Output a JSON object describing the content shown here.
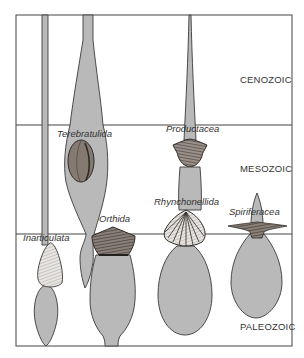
{
  "diagram": {
    "type": "spindle-diagram",
    "eras": [
      {
        "name": "CENOZOIC",
        "label_x": 240,
        "label_y": 83
      },
      {
        "name": "MESOZOIC",
        "label_x": 240,
        "label_y": 172
      },
      {
        "name": "PALEOZOIC",
        "label_x": 240,
        "label_y": 330
      }
    ],
    "taxa": [
      {
        "name": "Inarticulata",
        "label_x": 23,
        "label_y": 241
      },
      {
        "name": "Terebratulida",
        "label_x": 57,
        "label_y": 137
      },
      {
        "name": "Orthida",
        "label_x": 99,
        "label_y": 222
      },
      {
        "name": "Productacea",
        "label_x": 166,
        "label_y": 132
      },
      {
        "name": "Rhynchonellida",
        "label_x": 154,
        "label_y": 205
      },
      {
        "name": "Spiriferacea",
        "label_x": 229,
        "label_y": 215
      }
    ],
    "colors": {
      "spindle_fill": "#b9b9b9",
      "outline": "#3a3a3a",
      "shell_dark": "#5a5048",
      "background": "#ffffff"
    }
  }
}
